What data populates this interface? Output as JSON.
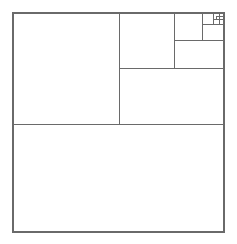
{
  "figure": {
    "canvas": {
      "width": 237,
      "height": 244
    },
    "background_color": "#ffffff",
    "line_color": "#6a6a6a",
    "line_width": 1,
    "outer_line_width": 1.4
  },
  "chart_data": {
    "type": "diagram",
    "subtype": "fibonacci-square-tiling",
    "bounds": {
      "x": 13,
      "y": 13,
      "width": 211,
      "height": 219
    },
    "squares": [
      {
        "name": "square-bottom",
        "order": 1,
        "side": 211,
        "x": 13,
        "y": 124,
        "w": 211,
        "h": 108
      },
      {
        "name": "square-top-left",
        "order": 2,
        "side": 106,
        "x": 13,
        "y": 13,
        "w": 106,
        "h": 111
      },
      {
        "name": "square-mid-right",
        "order": 3,
        "side": 56,
        "x": 119,
        "y": 68,
        "w": 105,
        "h": 56
      },
      {
        "name": "square-upper-mid",
        "order": 4,
        "side": 55,
        "x": 119,
        "y": 13,
        "w": 55,
        "h": 55
      },
      {
        "name": "square-upper-right",
        "order": 5,
        "side": 28,
        "x": 174,
        "y": 13,
        "w": 50,
        "h": 27
      },
      {
        "name": "square-nested-a",
        "order": 6,
        "side": 28,
        "x": 174,
        "y": 40,
        "w": 50,
        "h": 28
      },
      {
        "name": "square-nested-b",
        "order": 7,
        "side": 11,
        "x": 202,
        "y": 13,
        "w": 11,
        "h": 11
      },
      {
        "name": "square-nested-c",
        "order": 8,
        "side": 11,
        "x": 213,
        "y": 13,
        "w": 11,
        "h": 11
      },
      {
        "name": "square-nested-d",
        "order": 9,
        "side": 16,
        "x": 202,
        "y": 24,
        "w": 22,
        "h": 16
      },
      {
        "name": "square-nested-e",
        "order": 10,
        "side": 6,
        "x": 213,
        "y": 13,
        "w": 6,
        "h": 6
      },
      {
        "name": "square-nested-f",
        "order": 11,
        "side": 5,
        "x": 219,
        "y": 13,
        "w": 5,
        "h": 5
      },
      {
        "name": "square-nested-g",
        "order": 12,
        "side": 5,
        "x": 219,
        "y": 18,
        "w": 5,
        "h": 6
      },
      {
        "name": "square-nested-h",
        "order": 13,
        "side": 3,
        "x": 216,
        "y": 19,
        "w": 3,
        "h": 3
      }
    ],
    "lines": [
      {
        "name": "outer-border",
        "kind": "rect",
        "x1": 13,
        "y1": 13,
        "x2": 224,
        "y2": 232
      },
      {
        "name": "divider-bottom-horizontal",
        "kind": "h",
        "x1": 13,
        "x2": 224,
        "y": 124
      },
      {
        "name": "divider-vertical-main",
        "kind": "v",
        "x": 119,
        "y1": 13,
        "y2": 124
      },
      {
        "name": "divider-horizontal-right",
        "kind": "h",
        "x1": 119,
        "x2": 224,
        "y": 68
      },
      {
        "name": "divider-vertical-upper",
        "kind": "v",
        "x": 174,
        "y1": 13,
        "y2": 68
      },
      {
        "name": "divider-horizontal-upper",
        "kind": "h",
        "x1": 174,
        "x2": 224,
        "y": 40
      },
      {
        "name": "divider-vertical-nested",
        "kind": "v",
        "x": 202,
        "y1": 13,
        "y2": 40
      },
      {
        "name": "divider-horizontal-nested",
        "kind": "h",
        "x1": 202,
        "x2": 224,
        "y": 24
      },
      {
        "name": "divider-vertical-tiny",
        "kind": "v",
        "x": 213,
        "y1": 13,
        "y2": 24
      },
      {
        "name": "divider-horizontal-tiny",
        "kind": "h",
        "x1": 213,
        "x2": 224,
        "y": 19
      },
      {
        "name": "divider-vertical-micro",
        "kind": "v",
        "x": 219,
        "y1": 13,
        "y2": 24
      },
      {
        "name": "divider-horizontal-micro",
        "kind": "h",
        "x1": 216,
        "x2": 224,
        "y": 16
      },
      {
        "name": "divider-vertical-nano",
        "kind": "v",
        "x": 216,
        "y1": 16,
        "y2": 19
      }
    ]
  }
}
